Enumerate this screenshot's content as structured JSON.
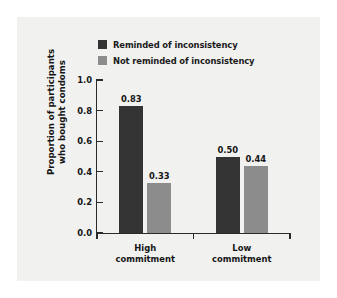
{
  "chart_data": {
    "type": "bar",
    "title": "",
    "subtitle": "",
    "xlabel": "",
    "ylabel": "Proportion of participants\nwho bought condoms",
    "ylim": [
      0.0,
      1.0
    ],
    "yticks": [
      "1.0",
      "0.8",
      "0.6",
      "0.4",
      "0.2",
      "0.0"
    ],
    "ytick_values": [
      1.0,
      0.8,
      0.6,
      0.4,
      0.2,
      0.0
    ],
    "grid": false,
    "legend_position": "top-left",
    "categories": [
      "High\ncommitment",
      "Low\ncommitment"
    ],
    "category_labels_flat": [
      "High commitment",
      "Low commitment"
    ],
    "series": [
      {
        "name": "Reminded of inconsistency",
        "color": "#333333",
        "values": [
          0.83,
          0.5
        ],
        "value_labels": [
          "0.83",
          "0.50"
        ]
      },
      {
        "name": "Not reminded of inconsistency",
        "color": "#8c8c8c",
        "values": [
          0.33,
          0.44
        ],
        "value_labels": [
          "0.33",
          "0.44"
        ]
      }
    ]
  },
  "colors": {
    "figure_background": "#ffffff",
    "panel_background": "#f1f1f0",
    "axis": "#2a2a2a",
    "text": "#151515",
    "series_dark": "#333333",
    "series_gray": "#8c8c8c"
  }
}
